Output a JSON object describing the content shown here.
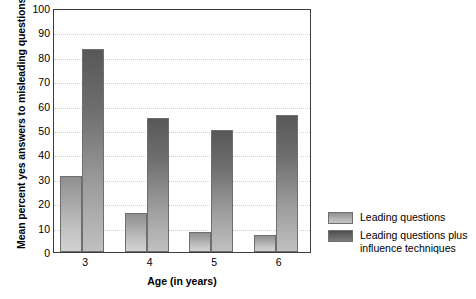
{
  "chart_data": {
    "type": "bar",
    "title": "",
    "xlabel": "Age (in years)",
    "ylabel": "Mean percent yes answers to misleading questions",
    "categories": [
      "3",
      "4",
      "5",
      "6"
    ],
    "series": [
      {
        "name": "Leading questions",
        "values": [
          31,
          16,
          8,
          7
        ]
      },
      {
        "name": "Leading questions plus\ninfluence techniques",
        "values": [
          83,
          55,
          50,
          56
        ]
      }
    ],
    "ylim": [
      0,
      100
    ],
    "yticks": [
      0,
      10,
      20,
      30,
      40,
      50,
      60,
      70,
      80,
      90,
      100
    ],
    "ytick_labels": [
      "0",
      "10",
      "20",
      "30",
      "40",
      "50",
      "60",
      "70",
      "80",
      "90",
      "100"
    ],
    "grid": true,
    "grid_axis": "y",
    "legend_position": "right",
    "colors": {
      "series_0_top": "#8f8f8f",
      "series_0_bottom": "#d2d2d2",
      "series_1_top": "#585858",
      "series_1_bottom": "#c0c0c0",
      "bar_border": "#6f6f6f",
      "axis": "#3c3c3c",
      "gridline": "#d2d2d2",
      "background": "#ffffff",
      "text": "#000000"
    }
  }
}
